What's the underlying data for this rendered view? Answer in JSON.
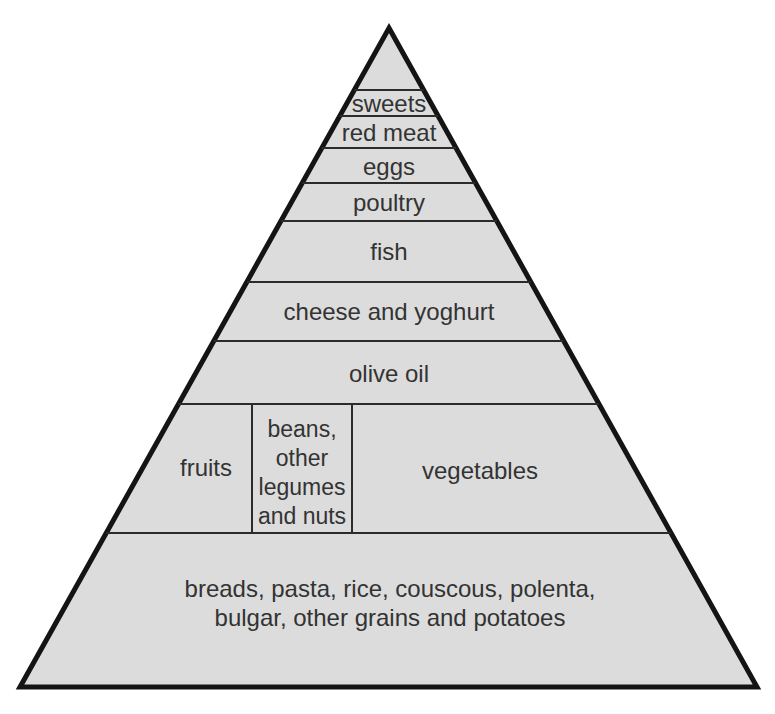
{
  "pyramid": {
    "name": "mediterranean-diet-food-pyramid",
    "levels_top_to_bottom": [
      {
        "name": "sweets",
        "label": "sweets"
      },
      {
        "name": "red-meat",
        "label": "red meat"
      },
      {
        "name": "eggs",
        "label": "eggs"
      },
      {
        "name": "poultry",
        "label": "poultry"
      },
      {
        "name": "fish",
        "label": "fish"
      },
      {
        "name": "cheese-and-yoghurt",
        "label": "cheese and yoghurt"
      },
      {
        "name": "olive-oil",
        "label": "olive oil"
      },
      {
        "name": "fruits-legumes-vegetables",
        "cells": [
          {
            "name": "fruits",
            "label": "fruits"
          },
          {
            "name": "beans-other-legumes-and-nuts",
            "label_lines": [
              "beans,",
              "other",
              "legumes",
              "and nuts"
            ]
          },
          {
            "name": "vegetables",
            "label": "vegetables"
          }
        ]
      },
      {
        "name": "grains-and-potatoes",
        "label_lines": [
          "breads, pasta, rice, couscous, polenta,",
          "bulgar, other grains and potatoes"
        ]
      }
    ],
    "colors": {
      "fill": "#dcdcdc",
      "outline": "#141414",
      "divider": "#2b2b2b",
      "text": "#333333",
      "background": "#ffffff"
    }
  }
}
